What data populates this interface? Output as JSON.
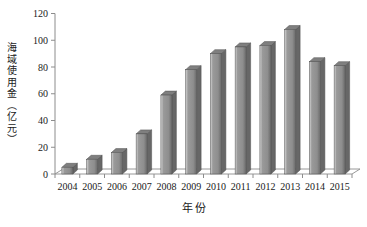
{
  "chart_data": {
    "type": "bar",
    "title": "",
    "xlabel": "年份",
    "ylabel": "海域使用金（亿元）",
    "categories": [
      "2004",
      "2005",
      "2006",
      "2007",
      "2008",
      "2009",
      "2010",
      "2011",
      "2012",
      "2013",
      "2014",
      "2015"
    ],
    "values": [
      5,
      11,
      16,
      30,
      59,
      78,
      90,
      95,
      96,
      108,
      84,
      81
    ],
    "ylim": [
      0,
      120
    ],
    "yticks": [
      0,
      20,
      40,
      60,
      80,
      100,
      120
    ],
    "grid": false,
    "legend": false,
    "effect": "3d",
    "style": {
      "background": "#ffffff",
      "bar_face": "#929292",
      "bar_highlight": "#c8c8c8",
      "bar_shadow": "#6d6d6d",
      "bar_top": "#7f7f7f",
      "bar_side": "#676767",
      "bar_outline": "#4f4f4f",
      "axis_color": "#8c8c8c",
      "text_color": "#1a1a1a"
    }
  }
}
